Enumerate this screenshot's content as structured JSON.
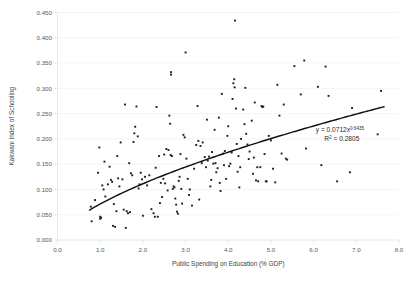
{
  "chart_data": {
    "type": "scatter",
    "title": "",
    "xlabel": "Public Spending on Education (% GDP)",
    "ylabel": "Kakwani Index of Schooling",
    "xlim": [
      0.0,
      8.0
    ],
    "ylim": [
      0.0,
      0.45
    ],
    "xticks": [
      "0.0",
      "1.0",
      "2.0",
      "3.0",
      "4.0",
      "5.0",
      "6.0",
      "7.0",
      "8.0"
    ],
    "xtick_values": [
      0.0,
      1.0,
      2.0,
      3.0,
      4.0,
      5.0,
      6.0,
      7.0,
      8.0
    ],
    "yticks": [
      "0.000",
      "0.050",
      "0.100",
      "0.150",
      "0.200",
      "0.250",
      "0.300",
      "0.350",
      "0.400",
      "0.450"
    ],
    "ytick_values": [
      0.0,
      0.05,
      0.1,
      0.15,
      0.2,
      0.25,
      0.3,
      0.35,
      0.4,
      0.45
    ],
    "grid": true,
    "grid_axis": "y",
    "legend": "none",
    "marker_color": "#1b1b1b",
    "marker_shape": "square",
    "marker_size": 1.9,
    "trendline": {
      "type": "power",
      "coefficient": 0.0712,
      "exponent": 0.6435,
      "r_squared": 0.2805,
      "color": "#111111",
      "x_start": 0.75,
      "x_end": 7.65
    },
    "annotations": [
      {
        "text_prefix": "y = 0.0712x",
        "text_sup": "0.6435",
        "x": 6.05,
        "y": 0.213
      },
      {
        "text_prefix": "R",
        "text_sup": "2",
        "text_suffix": " = 0.2805",
        "x": 6.25,
        "y": 0.196
      }
    ],
    "points": [
      [
        0.78,
        0.066
      ],
      [
        0.8,
        0.037
      ],
      [
        0.88,
        0.079
      ],
      [
        0.95,
        0.133
      ],
      [
        0.98,
        0.183
      ],
      [
        1.0,
        0.046
      ],
      [
        1.0,
        0.042
      ],
      [
        1.02,
        0.044
      ],
      [
        1.05,
        0.108
      ],
      [
        1.08,
        0.1
      ],
      [
        1.1,
        0.155
      ],
      [
        1.12,
        0.086
      ],
      [
        1.18,
        0.11
      ],
      [
        1.22,
        0.145
      ],
      [
        1.25,
        0.119
      ],
      [
        1.28,
        0.115
      ],
      [
        1.3,
        0.028
      ],
      [
        1.32,
        0.071
      ],
      [
        1.35,
        0.026
      ],
      [
        1.38,
        0.057
      ],
      [
        1.4,
        0.166
      ],
      [
        1.42,
        0.122
      ],
      [
        1.45,
        0.106
      ],
      [
        1.48,
        0.193
      ],
      [
        1.52,
        0.12
      ],
      [
        1.55,
        0.06
      ],
      [
        1.58,
        0.268
      ],
      [
        1.6,
        0.024
      ],
      [
        1.62,
        0.057
      ],
      [
        1.65,
        0.053
      ],
      [
        1.68,
        0.152
      ],
      [
        1.7,
        0.055
      ],
      [
        1.72,
        0.132
      ],
      [
        1.75,
        0.128
      ],
      [
        1.78,
        0.194
      ],
      [
        1.8,
        0.211
      ],
      [
        1.82,
        0.224
      ],
      [
        1.85,
        0.264
      ],
      [
        1.88,
        0.205
      ],
      [
        1.9,
        0.102
      ],
      [
        1.92,
        0.11
      ],
      [
        1.95,
        0.133
      ],
      [
        1.98,
        0.12
      ],
      [
        2.0,
        0.048
      ],
      [
        2.05,
        0.125
      ],
      [
        2.1,
        0.108
      ],
      [
        2.15,
        0.128
      ],
      [
        2.2,
        0.061
      ],
      [
        2.25,
        0.053
      ],
      [
        2.28,
        0.046
      ],
      [
        2.3,
        0.143
      ],
      [
        2.32,
        0.263
      ],
      [
        2.35,
        0.046
      ],
      [
        2.38,
        0.166
      ],
      [
        2.4,
        0.073
      ],
      [
        2.42,
        0.113
      ],
      [
        2.45,
        0.085
      ],
      [
        2.48,
        0.121
      ],
      [
        2.5,
        0.169
      ],
      [
        2.52,
        0.112
      ],
      [
        2.55,
        0.18
      ],
      [
        2.58,
        0.098
      ],
      [
        2.6,
        0.178
      ],
      [
        2.62,
        0.246
      ],
      [
        2.64,
        0.23
      ],
      [
        2.65,
        0.168
      ],
      [
        2.66,
        0.332
      ],
      [
        2.66,
        0.327
      ],
      [
        2.68,
        0.166
      ],
      [
        2.7,
        0.101
      ],
      [
        2.72,
        0.106
      ],
      [
        2.74,
        0.104
      ],
      [
        2.76,
        0.082
      ],
      [
        2.78,
        0.07
      ],
      [
        2.8,
        0.056
      ],
      [
        2.82,
        0.052
      ],
      [
        2.84,
        0.117
      ],
      [
        2.86,
        0.125
      ],
      [
        2.88,
        0.17
      ],
      [
        2.9,
        0.101
      ],
      [
        2.92,
        0.072
      ],
      [
        2.95,
        0.208
      ],
      [
        2.98,
        0.203
      ],
      [
        3.0,
        0.371
      ],
      [
        3.02,
        0.161
      ],
      [
        3.05,
        0.121
      ],
      [
        3.08,
        0.089
      ],
      [
        3.1,
        0.1
      ],
      [
        3.15,
        0.068
      ],
      [
        3.2,
        0.141
      ],
      [
        3.25,
        0.188
      ],
      [
        3.28,
        0.265
      ],
      [
        3.3,
        0.196
      ],
      [
        3.32,
        0.08
      ],
      [
        3.35,
        0.186
      ],
      [
        3.38,
        0.152
      ],
      [
        3.4,
        0.193
      ],
      [
        3.45,
        0.164
      ],
      [
        3.48,
        0.144
      ],
      [
        3.5,
        0.238
      ],
      [
        3.52,
        0.157
      ],
      [
        3.55,
        0.165
      ],
      [
        3.58,
        0.106
      ],
      [
        3.6,
        0.119
      ],
      [
        3.62,
        0.174
      ],
      [
        3.65,
        0.151
      ],
      [
        3.68,
        0.218
      ],
      [
        3.7,
        0.152
      ],
      [
        3.72,
        0.134
      ],
      [
        3.75,
        0.142
      ],
      [
        3.78,
        0.242
      ],
      [
        3.8,
        0.113
      ],
      [
        3.82,
        0.097
      ],
      [
        3.85,
        0.289
      ],
      [
        3.88,
        0.171
      ],
      [
        3.9,
        0.148
      ],
      [
        3.92,
        0.176
      ],
      [
        3.95,
        0.121
      ],
      [
        3.98,
        0.206
      ],
      [
        4.0,
        0.225
      ],
      [
        4.02,
        0.146
      ],
      [
        4.05,
        0.151
      ],
      [
        4.08,
        0.173
      ],
      [
        4.1,
        0.279
      ],
      [
        4.12,
        0.31
      ],
      [
        4.14,
        0.318
      ],
      [
        4.15,
        0.302
      ],
      [
        4.16,
        0.434
      ],
      [
        4.18,
        0.26
      ],
      [
        4.2,
        0.19
      ],
      [
        4.22,
        0.135
      ],
      [
        4.24,
        0.166
      ],
      [
        4.26,
        0.104
      ],
      [
        4.28,
        0.144
      ],
      [
        4.3,
        0.2
      ],
      [
        4.35,
        0.258
      ],
      [
        4.38,
        0.229
      ],
      [
        4.4,
        0.301
      ],
      [
        4.42,
        0.21
      ],
      [
        4.45,
        0.189
      ],
      [
        4.48,
        0.16
      ],
      [
        4.5,
        0.175
      ],
      [
        4.55,
        0.236
      ],
      [
        4.58,
        0.131
      ],
      [
        4.6,
        0.163
      ],
      [
        4.62,
        0.272
      ],
      [
        4.65,
        0.118
      ],
      [
        4.68,
        0.144
      ],
      [
        4.7,
        0.116
      ],
      [
        4.75,
        0.144
      ],
      [
        4.78,
        0.265
      ],
      [
        4.8,
        0.263
      ],
      [
        4.82,
        0.264
      ],
      [
        4.85,
        0.17
      ],
      [
        4.88,
        0.116
      ],
      [
        4.9,
        0.116
      ],
      [
        4.95,
        0.206
      ],
      [
        5.0,
        0.197
      ],
      [
        5.05,
        0.141
      ],
      [
        5.1,
        0.114
      ],
      [
        5.15,
        0.307
      ],
      [
        5.2,
        0.246
      ],
      [
        5.25,
        0.171
      ],
      [
        5.3,
        0.268
      ],
      [
        5.35,
        0.161
      ],
      [
        5.38,
        0.159
      ],
      [
        5.55,
        0.344
      ],
      [
        5.7,
        0.288
      ],
      [
        5.78,
        0.355
      ],
      [
        5.82,
        0.181
      ],
      [
        6.1,
        0.303
      ],
      [
        6.18,
        0.148
      ],
      [
        6.28,
        0.343
      ],
      [
        6.35,
        0.285
      ],
      [
        6.55,
        0.116
      ],
      [
        6.85,
        0.134
      ],
      [
        6.9,
        0.261
      ],
      [
        7.5,
        0.209
      ],
      [
        7.58,
        0.295
      ]
    ]
  }
}
